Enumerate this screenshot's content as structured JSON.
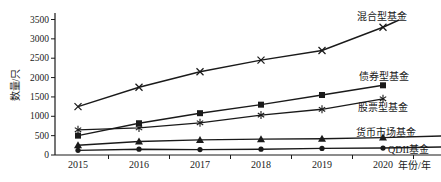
{
  "figure": {
    "background": "#ffffff",
    "ink_color": "#1a1a1a"
  },
  "chart_data": {
    "type": "line",
    "title": "",
    "xlabel": "年份/年",
    "ylabel": "数量/只",
    "categories": [
      "2015",
      "2016",
      "2017",
      "2018",
      "2019",
      "2020"
    ],
    "ylim": [
      0,
      3500
    ],
    "yticks": [
      0,
      500,
      1000,
      1500,
      2000,
      2500,
      3000,
      3500
    ],
    "grid": false,
    "legend_position": "inline-right-of-lines",
    "series": [
      {
        "name": "混合型基金",
        "marker": "x",
        "values": [
          1250,
          1750,
          2150,
          2450,
          2700,
          3300
        ],
        "label_pos": {
          "x": 357,
          "y": 16
        },
        "extend_to": {
          "x": 399,
          "y": 20
        }
      },
      {
        "name": "债券型基金",
        "marker": "square",
        "values": [
          500,
          820,
          1080,
          1300,
          1550,
          1800
        ],
        "label_pos": {
          "x": 359,
          "y": 76
        },
        "extend_to": null
      },
      {
        "name": "股票型基金",
        "marker": "asterisk",
        "values": [
          650,
          700,
          830,
          1030,
          1180,
          1450
        ],
        "label_pos": {
          "x": 358,
          "y": 107
        },
        "extend_to": null
      },
      {
        "name": "货币市场基金",
        "marker": "triangle",
        "values": [
          250,
          350,
          390,
          410,
          420,
          450
        ],
        "label_pos": {
          "x": 356,
          "y": 132
        },
        "extend_to": {
          "x": 441,
          "y": 136
        }
      },
      {
        "name": "QDII基金",
        "marker": "circle",
        "values": [
          120,
          150,
          140,
          150,
          170,
          180
        ],
        "label_pos": {
          "x": 388,
          "y": 149
        },
        "extend_to": {
          "x": 441,
          "y": 147
        }
      }
    ]
  }
}
